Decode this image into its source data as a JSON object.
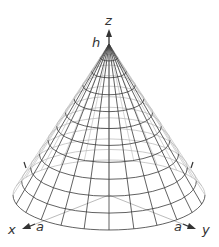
{
  "diagram": {
    "type": "3d-cone-wireframe",
    "labels": {
      "z_axis": "z",
      "x_axis": "x",
      "y_axis": "y",
      "height": "h",
      "radius_x": "a",
      "radius_y": "a"
    },
    "geometry": {
      "apex": [
        109,
        44
      ],
      "base_center": [
        109,
        195
      ],
      "base_rx": 96,
      "base_ry": 35,
      "rings": 11,
      "meridians": 24
    },
    "colors": {
      "front_lines": "#3a3a3a",
      "back_lines": "#b5b5b5",
      "axes": "#333333",
      "background": "#ffffff"
    }
  }
}
